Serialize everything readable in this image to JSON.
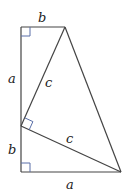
{
  "diagram": {
    "colors": {
      "line": "#444444",
      "right_angle_marker": "#5a6fa8",
      "label": "#222222"
    },
    "points": {
      "top_left": [
        21,
        27
      ],
      "top_right": [
        65,
        27
      ],
      "mid_left": [
        21,
        126
      ],
      "bottom_left": [
        21,
        172
      ],
      "bottom_right": [
        121,
        172
      ]
    },
    "labels": {
      "top_b": "b",
      "left_a": "a",
      "left_b": "b",
      "bottom_a": "a",
      "upper_c": "c",
      "lower_c": "c"
    }
  }
}
